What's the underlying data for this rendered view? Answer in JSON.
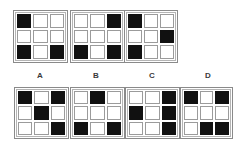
{
  "puzzle": {
    "type": "matrix-pattern-completion",
    "colors": {
      "filled": "#111111",
      "empty": "#ffffff",
      "cell_border": "#9b9b9b",
      "panel_border": "#8a8a8a",
      "label_text": "#3a3a3a",
      "background": "#ffffff"
    },
    "grid_size": {
      "rows": 3,
      "cols": 3
    },
    "sequence": [
      {
        "name": "sequence-panel-1",
        "cells": [
          [
            1,
            0,
            0
          ],
          [
            0,
            0,
            0
          ],
          [
            1,
            0,
            1
          ]
        ]
      },
      {
        "name": "sequence-panel-2",
        "cells": [
          [
            0,
            0,
            1
          ],
          [
            0,
            0,
            0
          ],
          [
            1,
            0,
            1
          ]
        ]
      },
      {
        "name": "sequence-panel-3",
        "cells": [
          [
            1,
            0,
            0
          ],
          [
            0,
            0,
            1
          ],
          [
            1,
            0,
            0
          ]
        ]
      }
    ],
    "options": [
      {
        "label": "A",
        "name": "option-a",
        "cells": [
          [
            1,
            0,
            1
          ],
          [
            0,
            1,
            0
          ],
          [
            0,
            0,
            1
          ]
        ]
      },
      {
        "label": "B",
        "name": "option-b",
        "cells": [
          [
            0,
            1,
            0
          ],
          [
            0,
            0,
            0
          ],
          [
            1,
            0,
            1
          ]
        ]
      },
      {
        "label": "C",
        "name": "option-c",
        "cells": [
          [
            0,
            0,
            1
          ],
          [
            1,
            0,
            1
          ],
          [
            0,
            0,
            1
          ]
        ]
      },
      {
        "label": "D",
        "name": "option-d",
        "cells": [
          [
            1,
            0,
            1
          ],
          [
            0,
            0,
            0
          ],
          [
            0,
            1,
            1
          ]
        ]
      }
    ]
  }
}
